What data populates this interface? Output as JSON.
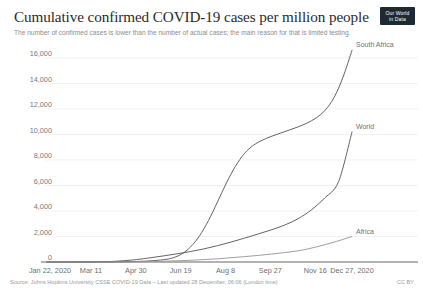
{
  "header": {
    "title": "Cumulative confirmed COVID-19 cases per million people",
    "subtitle": "The number of confirmed cases is lower than the number of actual cases; the main reason for that is limited testing.",
    "logo_line1": "Our World",
    "logo_line2": "in Data"
  },
  "footer": {
    "source": "Source: Johns Hopkins University CSSE COVID-19 Data – Last updated 28 December, 06:06 (London time)",
    "license": "CC BY"
  },
  "chart_data": {
    "type": "line",
    "title": "Cumulative confirmed COVID-19 cases per million people",
    "subtitle": "The number of confirmed cases is lower than the number of actual cases; the main reason for that is limited testing.",
    "xlabel": "",
    "ylabel": "",
    "grid": true,
    "legend_position": "right-inline-labels",
    "ylim": [
      0,
      16000
    ],
    "ytick_labels": [
      "0",
      "2,000",
      "4,000",
      "6,000",
      "8,000",
      "10,000",
      "12,000",
      "14,000",
      "16,000"
    ],
    "ytick_values": [
      0,
      2000,
      4000,
      6000,
      8000,
      10000,
      12000,
      14000,
      16000
    ],
    "xtick_labels": [
      "Jan 22, 2020",
      "Mar 11",
      "Apr 30",
      "Jun 19",
      "Aug 8",
      "Sep 27",
      "Nov 16",
      "Dec 27, 2020"
    ],
    "x_range": [
      "Jan 22, 2020",
      "Dec 27, 2020"
    ],
    "x_days": [
      0,
      49,
      99,
      149,
      199,
      249,
      299,
      340
    ],
    "series": [
      {
        "name": "South Africa",
        "color": "#5b5b5b",
        "x_days": [
          0,
          30,
          60,
          80,
          100,
          115,
          130,
          140,
          150,
          160,
          170,
          180,
          190,
          200,
          210,
          220,
          230,
          240,
          250,
          260,
          270,
          280,
          290,
          300,
          310,
          320,
          330,
          340
        ],
        "values": [
          0,
          0,
          2,
          8,
          40,
          90,
          180,
          320,
          620,
          1180,
          2050,
          3250,
          4700,
          6200,
          7500,
          8500,
          9150,
          9550,
          9850,
          10100,
          10350,
          10600,
          10900,
          11300,
          11900,
          12900,
          14500,
          16600
        ]
      },
      {
        "name": "World",
        "color": "#5b5b5b",
        "x_days": [
          0,
          30,
          60,
          80,
          100,
          115,
          130,
          145,
          160,
          175,
          190,
          205,
          220,
          235,
          250,
          265,
          280,
          295,
          310,
          325,
          340
        ],
        "values": [
          0,
          4,
          15,
          75,
          190,
          330,
          480,
          640,
          820,
          1030,
          1280,
          1560,
          1870,
          2190,
          2520,
          2900,
          3400,
          4100,
          5050,
          6300,
          10200
        ]
      },
      {
        "name": "Africa",
        "color": "#9a9a9a",
        "x_days": [
          0,
          40,
          70,
          100,
          130,
          160,
          190,
          220,
          250,
          280,
          300,
          320,
          340
        ],
        "values": [
          0,
          0,
          3,
          20,
          60,
          130,
          250,
          420,
          620,
          880,
          1180,
          1560,
          2000
        ]
      }
    ]
  }
}
